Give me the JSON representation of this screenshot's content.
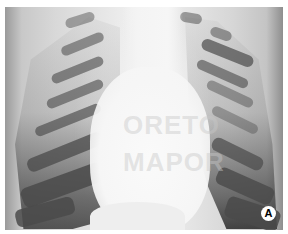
{
  "image": {
    "description": "Chest X-ray (frontal view) with enlarged cardiac silhouette",
    "panel_label": "A",
    "watermark_lines": [
      "ORETO",
      "MAPOR"
    ]
  }
}
